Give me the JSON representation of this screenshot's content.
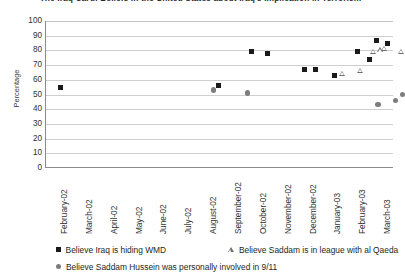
{
  "chart_data": {
    "type": "scatter",
    "title": "The Iraq Card: Beliefs in the United States about Iraq's Implication in Terrorism",
    "xlabel": "",
    "ylabel": "Percentage",
    "ylim": [
      0,
      100
    ],
    "ytick_step": 10,
    "grid": true,
    "legend_position": "bottom",
    "categories": [
      "February-02",
      "March-02",
      "April-02",
      "May-02",
      "June-02",
      "July-02",
      "August-02",
      "September-02",
      "October-02",
      "November-02",
      "December-02",
      "January-03",
      "February-03",
      "March-03"
    ],
    "ytick_labels": [
      "100",
      "90",
      "80",
      "70",
      "60",
      "50",
      "40",
      "30",
      "20",
      "10",
      "0"
    ],
    "series": [
      {
        "name": "Believe Iraq is hiding WMD",
        "marker": "square",
        "color": "#1a1a1a",
        "points": [
          {
            "x": 0.1,
            "y": 55
          },
          {
            "x": 6.45,
            "y": 56
          },
          {
            "x": 7.75,
            "y": 79
          },
          {
            "x": 8.4,
            "y": 78
          },
          {
            "x": 9.9,
            "y": 67
          },
          {
            "x": 10.35,
            "y": 67
          },
          {
            "x": 11.1,
            "y": 63
          },
          {
            "x": 12.05,
            "y": 79
          },
          {
            "x": 12.5,
            "y": 74
          },
          {
            "x": 12.8,
            "y": 87
          },
          {
            "x": 13.25,
            "y": 85
          }
        ]
      },
      {
        "name": "Believe Saddam is in league with al Qaeda",
        "marker": "triangle",
        "color": "#6e6e6e",
        "points": [
          {
            "x": 11.4,
            "y": 64
          },
          {
            "x": 12.15,
            "y": 66
          },
          {
            "x": 12.65,
            "y": 79
          },
          {
            "x": 12.95,
            "y": 80
          },
          {
            "x": 13.1,
            "y": 81
          },
          {
            "x": 13.8,
            "y": 79
          }
        ]
      },
      {
        "name": "Believe Saddam Hussein was personally involved in 9/11",
        "marker": "circle",
        "color": "#7d7d7d",
        "points": [
          {
            "x": 6.25,
            "y": 53
          },
          {
            "x": 7.6,
            "y": 51
          },
          {
            "x": 12.85,
            "y": 43
          },
          {
            "x": 13.55,
            "y": 46
          },
          {
            "x": 13.85,
            "y": 50
          }
        ]
      }
    ]
  },
  "legend": {
    "wmd": "Believe Iraq is hiding WMD",
    "qaeda": "Believe Saddam is in league with al Qaeda",
    "nine_eleven": "Believe Saddam Hussein was personally involved in 9/11"
  }
}
